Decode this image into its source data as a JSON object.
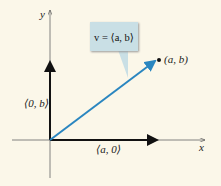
{
  "diagram": {
    "axes": {
      "x_label": "x",
      "y_label": "y"
    },
    "origin": [
      50,
      140
    ],
    "vector": {
      "label": "v = ⟨a, b⟩",
      "color": "#2a86c0",
      "tip": [
        156,
        60
      ]
    },
    "point": {
      "label": "(a, b)"
    },
    "horizontal_component": {
      "label": "⟨a, 0⟩"
    },
    "vertical_component": {
      "label": "⟨0, b⟩"
    }
  }
}
